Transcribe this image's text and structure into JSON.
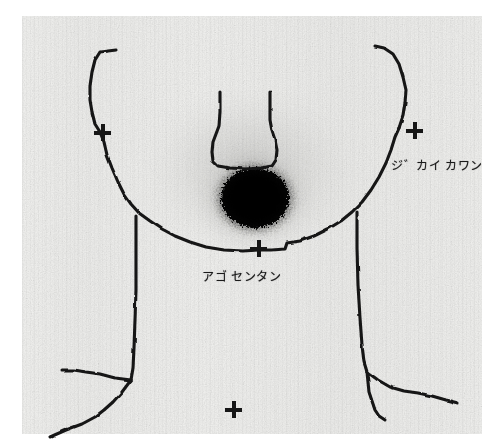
{
  "image": {
    "type": "thyroid-scintigram",
    "width": 499,
    "height": 448,
    "background_color": "#f0f0ee",
    "ink_color": "#161616"
  },
  "labels": {
    "right_jaw": "ジ゛カイ  カワン",
    "chin_tip": "アゴ  センタン"
  },
  "markers": [
    {
      "name": "left-jaw",
      "label": "+",
      "x": 102,
      "y": 132
    },
    {
      "name": "right-jaw",
      "label": "+",
      "x": 414,
      "y": 130
    },
    {
      "name": "chin-tip",
      "label": "+",
      "x": 258,
      "y": 248
    },
    {
      "name": "lower-reference",
      "label": "+",
      "x": 233,
      "y": 409
    }
  ],
  "uptake": {
    "name": "thyroid-uptake-focus",
    "center_x": 255,
    "center_y": 198,
    "radius": 42,
    "intensity": "high"
  },
  "outline": {
    "name": "head-neck-contour",
    "description": "hand-drawn face, jaw, nose and neck/shoulder contour"
  }
}
